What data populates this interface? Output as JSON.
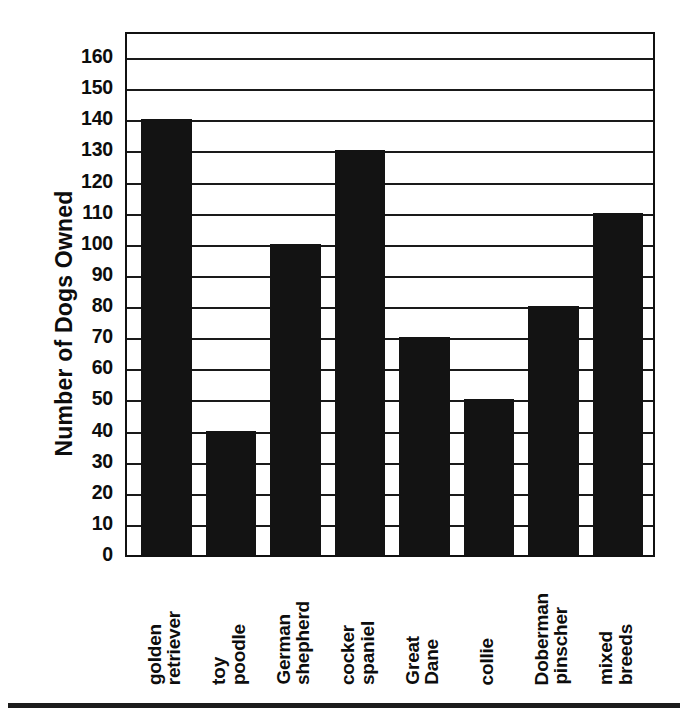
{
  "chart_data": {
    "type": "bar",
    "title": "",
    "xlabel": "",
    "ylabel": "Number of Dogs Owned",
    "categories": [
      "golden retriever",
      "toy poodle",
      "German shepherd",
      "cocker spaniel",
      "Great Dane",
      "collie",
      "Doberman pinscher",
      "mixed breeds"
    ],
    "category_lines": [
      [
        "golden",
        "retriever"
      ],
      [
        "toy",
        "poodle"
      ],
      [
        "German",
        "shepherd"
      ],
      [
        "cocker",
        "spaniel"
      ],
      [
        "Great",
        "Dane"
      ],
      [
        "collie"
      ],
      [
        "Doberman",
        "pinscher"
      ],
      [
        "mixed",
        "breeds"
      ]
    ],
    "values": [
      140,
      40,
      100,
      130,
      70,
      50,
      80,
      110
    ],
    "ylim": [
      0,
      160
    ],
    "ytick_step": 10,
    "yticks": [
      0,
      10,
      20,
      30,
      40,
      50,
      60,
      70,
      80,
      90,
      100,
      110,
      120,
      130,
      140,
      150,
      160
    ],
    "ytick_labels": [
      "0",
      "10",
      "20",
      "30",
      "40",
      "50",
      "60",
      "70",
      "80",
      "90",
      "100",
      "110",
      "120",
      "130",
      "140",
      "150",
      "160"
    ],
    "grid": true,
    "grid_axis": "y",
    "legend": false,
    "bar_color": "#131313",
    "axis_color": "#111111",
    "background_color": "#ffffff",
    "label_rotation": -90
  }
}
